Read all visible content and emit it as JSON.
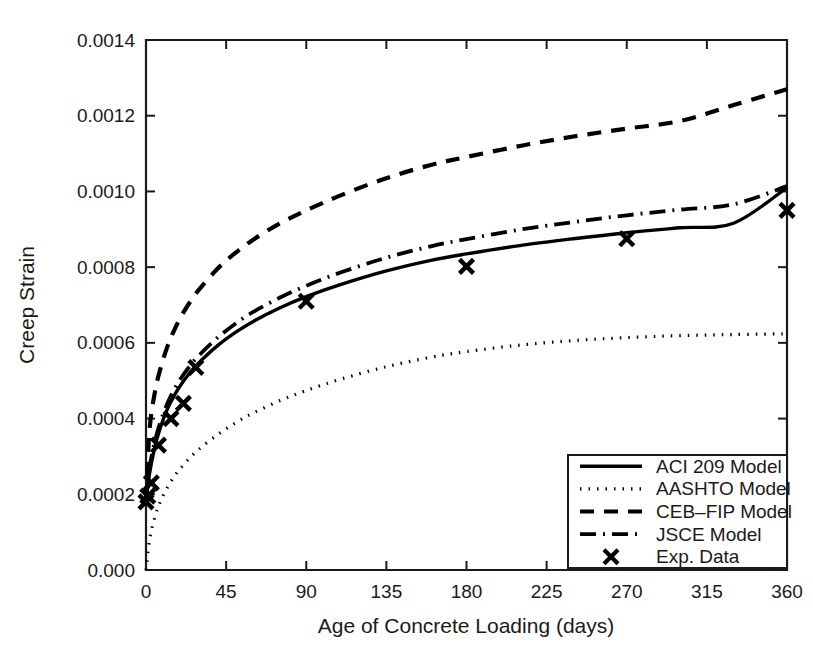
{
  "chart_data": {
    "type": "line",
    "title": "",
    "xlabel": "Age of Concrete Loading (days)",
    "ylabel": "Creep Strain",
    "xlim": [
      0,
      360
    ],
    "ylim": [
      0.0,
      0.0014
    ],
    "grid": false,
    "legend_position": "lower-right",
    "xticks": [
      0,
      45,
      90,
      135,
      180,
      225,
      270,
      315,
      360
    ],
    "xtick_labels": [
      "0",
      "45",
      "90",
      "135",
      "180",
      "225",
      "270",
      "315",
      "360"
    ],
    "yticks": [
      0.0,
      0.0002,
      0.0004,
      0.0006,
      0.0008,
      0.001,
      0.0012,
      0.0014
    ],
    "ytick_labels": [
      "0.000",
      "0.0002",
      "0.0004",
      "0.0006",
      "0.0008",
      "0.0010",
      "0.0012",
      "0.0014"
    ],
    "series": [
      {
        "name": "ACI 209 Model",
        "style": "solid",
        "color": "#000000",
        "x": [
          0,
          2,
          5,
          8,
          12,
          16,
          20,
          25,
          30,
          40,
          50,
          60,
          75,
          90,
          110,
          135,
          160,
          180,
          210,
          240,
          270,
          300,
          330,
          360
        ],
        "values": [
          0.00018,
          0.000255,
          0.000325,
          0.000375,
          0.000425,
          0.000462,
          0.000492,
          0.000523,
          0.000549,
          0.000592,
          0.000627,
          0.000656,
          0.000692,
          0.000722,
          0.000755,
          0.00079,
          0.000818,
          0.000835,
          0.000857,
          0.000875,
          0.000891,
          0.000904,
          0.000916,
          0.00101
        ]
      },
      {
        "name": "AASHTO Model",
        "style": "dotted",
        "color": "#000000",
        "x": [
          0,
          2,
          5,
          8,
          12,
          16,
          20,
          25,
          30,
          40,
          50,
          60,
          75,
          90,
          110,
          135,
          160,
          180,
          210,
          240,
          270,
          300,
          330,
          360
        ],
        "values": [
          0.0,
          8e-05,
          0.00014,
          0.00018,
          0.000218,
          0.000248,
          0.000272,
          0.000298,
          0.00032,
          0.000357,
          0.000388,
          0.000414,
          0.000447,
          0.000474,
          0.000505,
          0.000537,
          0.000562,
          0.000577,
          0.000594,
          0.000606,
          0.000614,
          0.000619,
          0.000622,
          0.000624
        ]
      },
      {
        "name": "CEB-FIP Model",
        "style": "dashed",
        "color": "#000000",
        "x": [
          0,
          2,
          5,
          8,
          12,
          16,
          20,
          25,
          30,
          40,
          50,
          60,
          75,
          90,
          110,
          135,
          160,
          180,
          210,
          240,
          270,
          300,
          330,
          360
        ],
        "values": [
          0.000185,
          0.00037,
          0.00047,
          0.00053,
          0.00059,
          0.000635,
          0.000672,
          0.00071,
          0.000742,
          0.000795,
          0.000837,
          0.000872,
          0.000915,
          0.00095,
          0.000991,
          0.001035,
          0.00107,
          0.001091,
          0.00112,
          0.001145,
          0.001166,
          0.001186,
          0.001228,
          0.00127
        ]
      },
      {
        "name": "JSCE Model",
        "style": "dashdot",
        "color": "#000000",
        "x": [
          0,
          2,
          5,
          8,
          12,
          16,
          20,
          25,
          30,
          40,
          50,
          60,
          75,
          90,
          110,
          135,
          160,
          180,
          210,
          240,
          270,
          300,
          330,
          360
        ],
        "values": [
          0.00018,
          0.00027,
          0.00034,
          0.00039,
          0.00044,
          0.000478,
          0.000509,
          0.000541,
          0.000568,
          0.000613,
          0.00065,
          0.000681,
          0.000719,
          0.000751,
          0.000787,
          0.000825,
          0.000855,
          0.000874,
          0.000899,
          0.000919,
          0.000937,
          0.000952,
          0.000966,
          0.001014
        ]
      },
      {
        "name": "Exp. Data",
        "style": "marker",
        "marker": "x",
        "color": "#000000",
        "x": [
          0,
          1,
          3,
          7,
          14,
          21,
          28,
          90,
          180,
          270,
          360
        ],
        "values": [
          0.00018,
          0.000195,
          0.00023,
          0.00033,
          0.0004,
          0.00044,
          0.000535,
          0.00071,
          0.000802,
          0.000875,
          0.00095
        ]
      }
    ]
  },
  "legend": {
    "entries": [
      {
        "label": "ACI 209 Model",
        "style": "solid"
      },
      {
        "label": "AASHTO Model",
        "style": "dotted"
      },
      {
        "label": "CEB–FIP Model",
        "style": "dashed"
      },
      {
        "label": "JSCE Model",
        "style": "dashdot"
      },
      {
        "label": "Exp. Data",
        "style": "marker"
      }
    ]
  }
}
